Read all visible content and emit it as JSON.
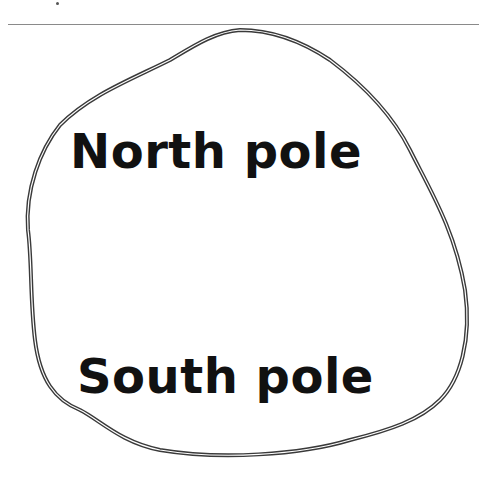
{
  "diagram": {
    "type": "magnet-poles-sketch",
    "labels": {
      "north": "North pole",
      "south": "South pole"
    },
    "colors": {
      "outline": "#3a3a3a",
      "text": "#111111",
      "rule": "#8a8a8a",
      "background": "#ffffff"
    }
  }
}
